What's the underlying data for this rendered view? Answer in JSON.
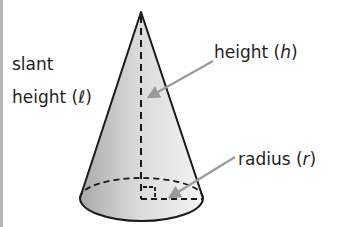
{
  "diagram": {
    "type": "cone",
    "labels": {
      "slant_line1": "slant",
      "slant_line2": "height (",
      "slant_var": "ℓ",
      "slant_close": ")",
      "height_text": "height (",
      "height_var": "h",
      "height_close": ")",
      "radius_text": "radius (",
      "radius_var": "r",
      "radius_close": ")"
    },
    "colors": {
      "outline": "#1a1a1a",
      "fill_light": "#f2f2f2",
      "fill_dark": "#b9b9b9",
      "arrow": "#9a9a9a",
      "text": "#231f20",
      "border": "#b8b8b8"
    }
  }
}
